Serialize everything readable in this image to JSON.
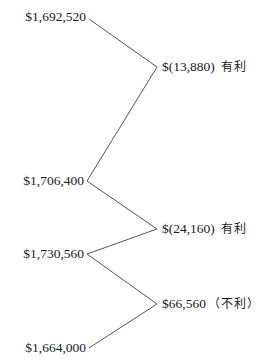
{
  "diagram": {
    "type": "variance-analysis",
    "amounts": [
      {
        "label": "$1,692,520"
      },
      {
        "label": "$1,706,400"
      },
      {
        "label": "$1,730,560"
      },
      {
        "label": "$1,664,000"
      }
    ],
    "variances": [
      {
        "amount": "$(13,880)",
        "tag": "有利"
      },
      {
        "amount": "$(24,160)",
        "tag": "有利"
      },
      {
        "amount": "$66,560",
        "tag": "（不利）"
      }
    ],
    "line_color": "#555555",
    "text_color": "#1a1a1a"
  }
}
